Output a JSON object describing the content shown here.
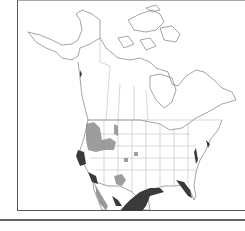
{
  "map": {
    "region": "North America",
    "type": "species range map",
    "projection_lines": "state and province boundaries",
    "colors": {
      "outline": "#555555",
      "range_dark": "#3a3a3a",
      "range_light": "#8c8c8c",
      "background": "#ffffff"
    },
    "legend": [],
    "labels": []
  }
}
